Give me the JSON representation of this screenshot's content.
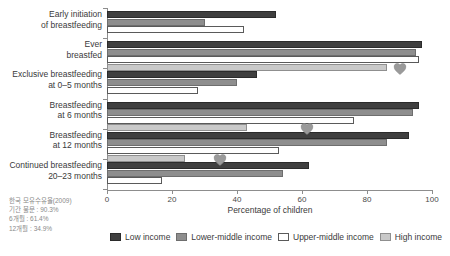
{
  "chart_data": {
    "type": "bar",
    "orientation": "horizontal",
    "title": "",
    "xlabel": "Percentage of children",
    "ylabel": "",
    "xlim": [
      0,
      100
    ],
    "xticks": [
      0,
      20,
      40,
      60,
      80,
      100
    ],
    "grid": false,
    "legend_position": "bottom",
    "categories": [
      "Early initiation of breastfeeding",
      "Ever breastfed",
      "Exclusive breastfeeding at 0–5 months",
      "Breastfeeding at 6 months",
      "Breastfeeding at 12 months",
      "Continued breastfeeding 20–23 months"
    ],
    "category_lines": [
      [
        "Early initiation",
        "of breastfeeding"
      ],
      [
        "Ever",
        "breastfed"
      ],
      [
        "Exclusive breastfeeding",
        "at 0–5 months"
      ],
      [
        "Breastfeeding",
        "at 6 months"
      ],
      [
        "Breastfeeding",
        "at 12 months"
      ],
      [
        "Continued breastfeeding",
        "20–23 months"
      ]
    ],
    "series": [
      {
        "name": "Low income",
        "key": "low",
        "color": "#3f3f3f",
        "values": [
          52,
          97,
          46,
          96,
          93,
          62
        ]
      },
      {
        "name": "Lower-middle income",
        "key": "lowermid",
        "color": "#8e8e8e",
        "values": [
          30,
          95,
          40,
          94,
          86,
          54
        ]
      },
      {
        "name": "Upper-middle income",
        "key": "uppermid",
        "color": "#ffffff",
        "values": [
          42,
          96,
          28,
          76,
          53,
          17
        ]
      },
      {
        "name": "High income",
        "key": "high",
        "color": "#c9c9c9",
        "values": [
          null,
          86,
          null,
          43,
          24,
          null
        ]
      }
    ],
    "markers": {
      "name": "Korea breastfeeding rate marker",
      "shape": "heart",
      "color": "#9a9a9a",
      "points": [
        {
          "category": "Ever breastfed",
          "value": 90.3
        },
        {
          "category": "Breastfeeding at 6 months",
          "value": 61.4
        },
        {
          "category": "Breastfeeding at 12 months",
          "value": 34.9
        }
      ]
    }
  },
  "legend": {
    "items": [
      {
        "label": "Low income",
        "key": "low"
      },
      {
        "label": "Lower-middle income",
        "key": "lowermid"
      },
      {
        "label": "Upper-middle income",
        "key": "uppermid"
      },
      {
        "label": "High income",
        "key": "high"
      }
    ]
  },
  "annotation": {
    "lines": [
      "한국 모유수유율(2009)",
      "기간 불문 : 90.3%",
      "6개월 : 61.4%",
      "12개월 : 34.9%"
    ]
  },
  "axis": {
    "x_title": "Percentage of children",
    "tick_labels": [
      "0",
      "20",
      "40",
      "60",
      "80",
      "100"
    ]
  }
}
